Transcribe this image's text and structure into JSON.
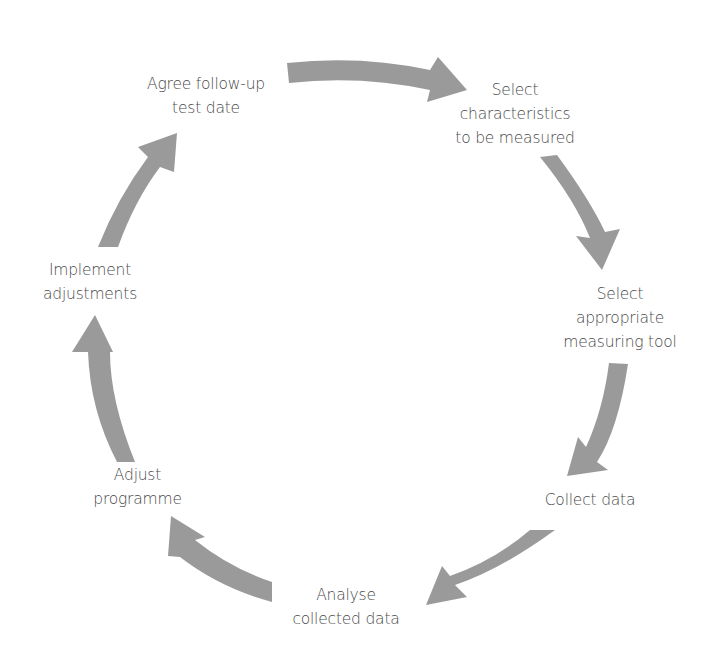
{
  "diagram": {
    "type": "cycle",
    "arrow_color": "#9a9a9a",
    "text_color": "#4a4a4a",
    "steps": [
      {
        "lines": [
          "Select",
          "characteristics",
          "to be measured"
        ]
      },
      {
        "lines": [
          "Select",
          "appropriate",
          "measuring tool"
        ]
      },
      {
        "lines": [
          "Collect data"
        ]
      },
      {
        "lines": [
          "Analyse",
          "collected data"
        ]
      },
      {
        "lines": [
          "Adjust",
          "programme"
        ]
      },
      {
        "lines": [
          "Implement",
          "adjustments"
        ]
      },
      {
        "lines": [
          "Agree follow-up",
          "test date"
        ]
      }
    ]
  }
}
